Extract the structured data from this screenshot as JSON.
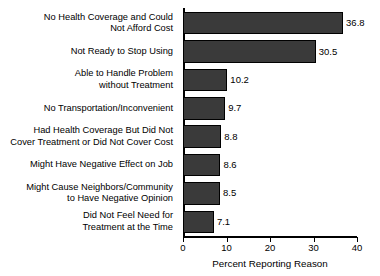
{
  "chart_data": {
    "type": "bar",
    "orientation": "horizontal",
    "title": "",
    "xlabel": "Percent Reporting Reason",
    "ylabel": "",
    "xlim": [
      0,
      40
    ],
    "xticks": [
      0,
      10,
      20,
      30,
      40
    ],
    "grid": false,
    "legend": null,
    "bar_color": "#3a3a3a",
    "bar_edge_color": "#000000",
    "categories": [
      "No Health Coverage and Could\nNot Afford Cost",
      "Not Ready to Stop Using",
      "Able to Handle Problem\nwithout Treatment",
      "No Transportation/Inconvenient",
      "Had Health Coverage But Did Not\nCover Treatment or Did Not Cover Cost",
      "Might Have Negative Effect on Job",
      "Might Cause Neighbors/Community\nto Have Negative Opinion",
      "Did Not Feel Need for\nTreatment at the Time"
    ],
    "values": [
      36.8,
      30.5,
      10.2,
      9.7,
      8.8,
      8.6,
      8.5,
      7.1
    ],
    "value_labels": [
      "36.8",
      "30.5",
      "10.2",
      "9.7",
      "8.8",
      "8.6",
      "8.5",
      "7.1"
    ],
    "tick_labels": [
      "0",
      "10",
      "20",
      "30",
      "40"
    ]
  }
}
